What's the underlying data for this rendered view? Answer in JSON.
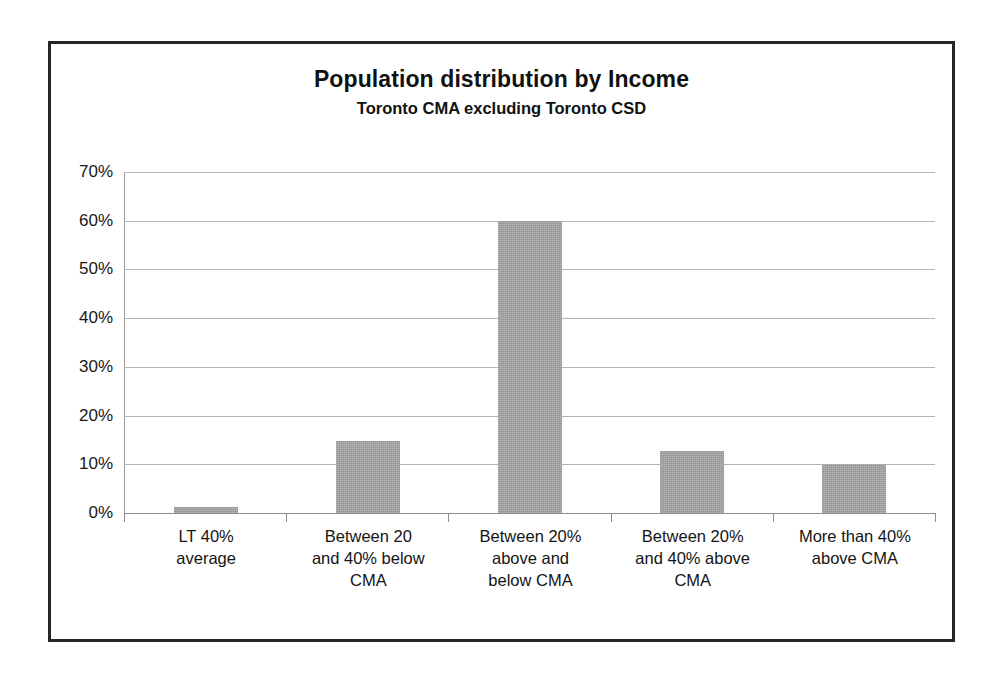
{
  "chart_data": {
    "type": "bar",
    "title": "Population distribution by Income",
    "subtitle": "Toronto CMA excluding Toronto CSD",
    "xlabel": "",
    "ylabel": "",
    "ylim": [
      0,
      70
    ],
    "ytick_labels": [
      "70%",
      "60%",
      "50%",
      "40%",
      "30%",
      "20%",
      "10%",
      "0%"
    ],
    "ytick_values": [
      70,
      60,
      50,
      40,
      30,
      20,
      10,
      0
    ],
    "grid": "horizontal",
    "legend": "none",
    "bar_color": "#a3a3a3",
    "categories": [
      "LT 40%\naverage",
      "Between 20\nand 40% below\nCMA",
      "Between 20%\nabove and\nbelow CMA",
      "Between 20%\nand 40% above\nCMA",
      "More than 40%\nabove CMA"
    ],
    "values": [
      1.3,
      14.8,
      60.0,
      12.7,
      10.0
    ]
  }
}
